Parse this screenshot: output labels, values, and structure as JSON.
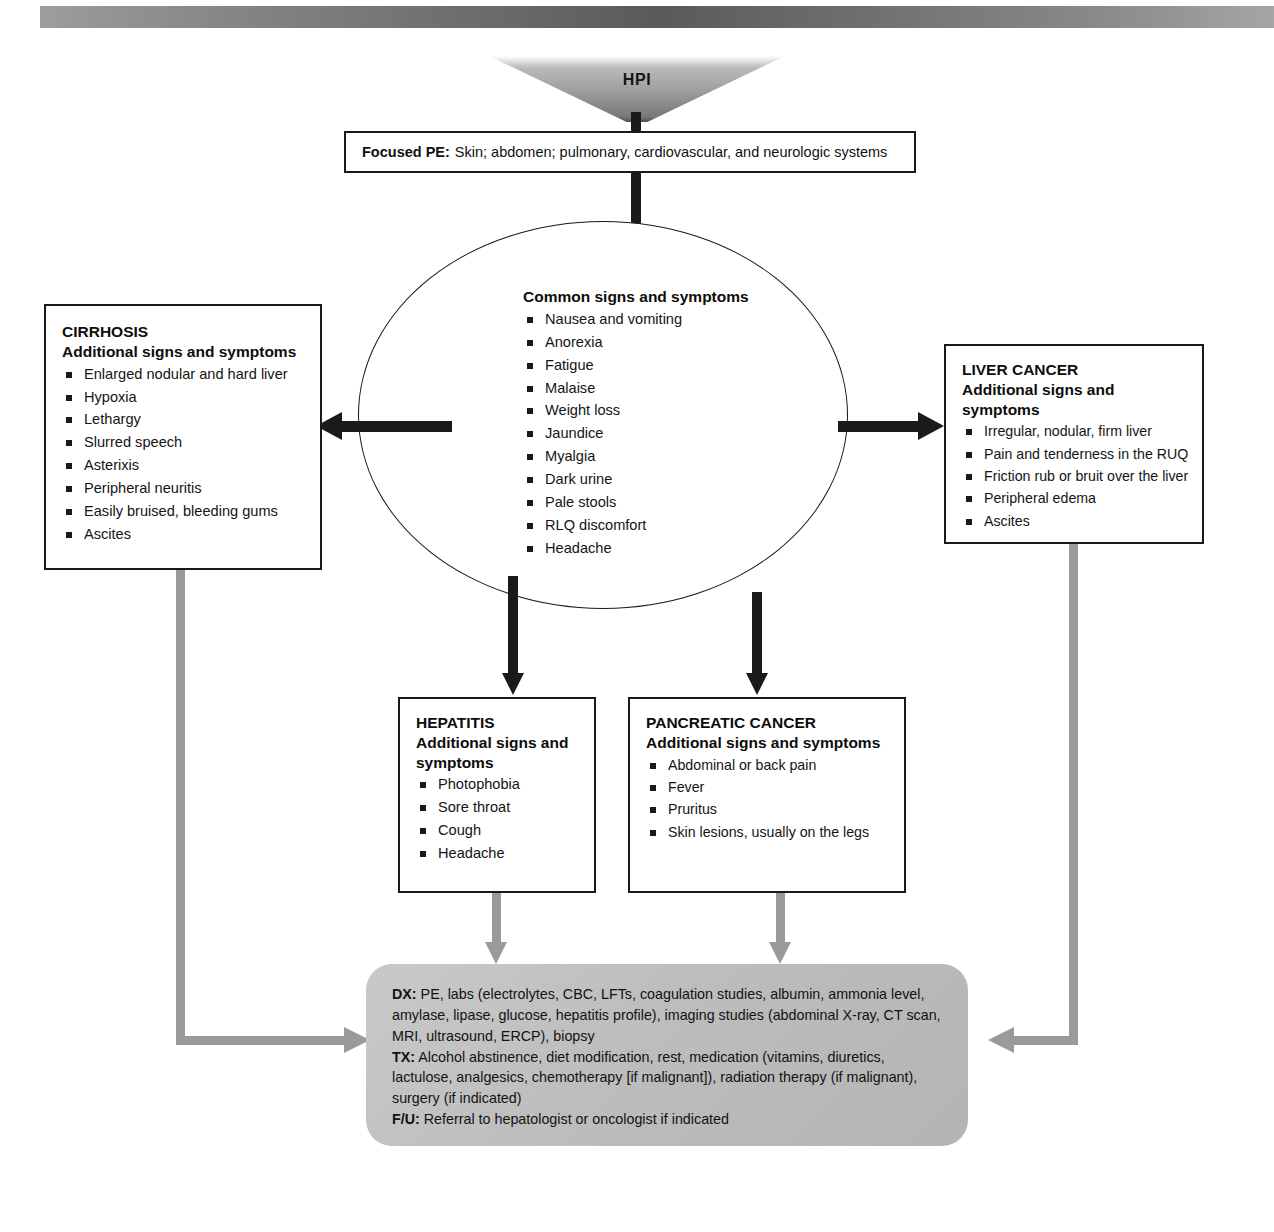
{
  "header": {
    "decorative_bar": true
  },
  "entry": {
    "funnel_label": "HPI",
    "focused_pe": {
      "lead": "Focused PE:",
      "text": "Skin; abdomen; pulmonary, cardiovascular, and neurologic systems"
    }
  },
  "circle": {
    "title": "Common signs and symptoms",
    "items": [
      "Nausea and vomiting",
      "Anorexia",
      "Fatigue",
      "Malaise",
      "Weight loss",
      "Jaundice",
      "Myalgia",
      "Dark urine",
      "Pale stools",
      "RLQ discomfort",
      "Headache"
    ]
  },
  "branches": {
    "cirrhosis": {
      "title": "CIRRHOSIS",
      "subtitle": "Additional signs and symptoms",
      "items": [
        "Enlarged nodular and hard liver",
        "Hypoxia",
        "Lethargy",
        "Slurred speech",
        "Asterixis",
        "Peripheral neuritis",
        "Easily bruised, bleeding gums",
        "Ascites"
      ]
    },
    "liver_cancer": {
      "title": "LIVER CANCER",
      "subtitle": "Additional signs and symptoms",
      "items": [
        "Irregular, nodular, firm liver",
        "Pain and tenderness in the RUQ",
        "Friction rub or bruit over the liver",
        "Peripheral edema",
        "Ascites"
      ]
    },
    "hepatitis": {
      "title": "HEPATITIS",
      "subtitle": "Additional signs and symptoms",
      "items": [
        "Photophobia",
        "Sore throat",
        "Cough",
        "Headache"
      ]
    },
    "pancreatic_cancer": {
      "title": "PANCREATIC CANCER",
      "subtitle": "Additional signs and symptoms",
      "items": [
        "Abdominal or back pain",
        "Fever",
        "Pruritus",
        "Skin lesions, usually on the legs"
      ]
    }
  },
  "plan": {
    "dx_lead": "DX:",
    "dx_text": "PE, labs (electrolytes, CBC, LFTs, coagulation studies, albumin, ammonia level, amylase, lipase, glucose, hepatitis profile), imaging studies (abdominal X-ray, CT scan, MRI, ultrasound, ERCP), biopsy",
    "tx_lead": "TX:",
    "tx_text": "Alcohol abstinence, diet modification, rest, medication (vitamins, diuretics, lactulose, analgesics, chemotherapy [if malignant]), radiation therapy (if malignant), surgery (if indicated)",
    "fu_lead": "F/U:",
    "fu_text": "Referral to hepatologist or oncologist if indicated"
  },
  "colors": {
    "ink": "#1a1a1a",
    "gray_connector": "#9a9a9a",
    "plan_fill": "#bdbdbd"
  }
}
